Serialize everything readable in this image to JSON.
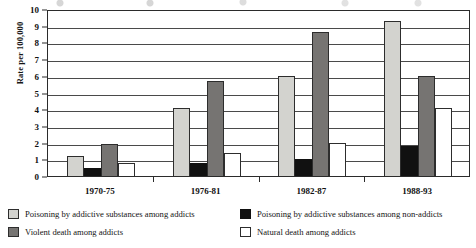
{
  "chart_data": {
    "type": "bar",
    "title": "",
    "subtitle": "",
    "xlabel": "",
    "ylabel": "Rate per 100,000",
    "ylim": [
      0,
      10
    ],
    "ytick_labels": [
      "10",
      "9",
      "8",
      "7",
      "6",
      "5",
      "4",
      "3",
      "2",
      "1",
      "0"
    ],
    "ytick_values": [
      10,
      9,
      8,
      7,
      6,
      5,
      4,
      3,
      2,
      1,
      0
    ],
    "grid": true,
    "legend_position": "bottom",
    "categories": [
      "1970-75",
      "1976-81",
      "1982-87",
      "1988-93"
    ],
    "series": [
      {
        "name": "Poisoning by addictive substances among addicts",
        "color": "#d3d3cf",
        "values": [
          1.2,
          4.1,
          6.0,
          9.3
        ]
      },
      {
        "name": "Poisoning by addictive substances among non-addicts",
        "color": "#111111",
        "values": [
          0.5,
          0.8,
          1.0,
          1.8
        ]
      },
      {
        "name": "Violent death among addicts",
        "color": "#767472",
        "values": [
          1.9,
          5.7,
          8.6,
          6.0
        ]
      },
      {
        "name": "Natural death among addicts",
        "color": "#ffffff",
        "values": [
          0.8,
          1.4,
          2.0,
          4.1
        ]
      }
    ]
  },
  "legend": {
    "entries": [
      {
        "label": "Poisoning by addictive substances among addicts",
        "swatch": "light-gray-swatch"
      },
      {
        "label": "Poisoning by addictive substances among non-addicts",
        "swatch": "black-swatch"
      },
      {
        "label": "Violent death among addicts",
        "swatch": "dark-gray-swatch"
      },
      {
        "label": "Natural death among addicts",
        "swatch": "white-swatch"
      }
    ]
  },
  "colors": {
    "series_light_gray": "#d3d3cf",
    "series_black": "#111111",
    "series_dark_gray": "#767472",
    "series_white": "#ffffff",
    "axis": "#2b2b2b",
    "gridline": "#4a4a4a",
    "background": "#ffffff"
  }
}
